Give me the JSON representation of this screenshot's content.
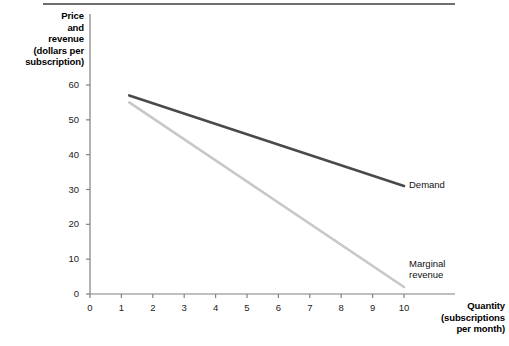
{
  "chart_data": {
    "type": "line",
    "title": "",
    "xlabel": "Quantity (subscriptions per month)",
    "ylabel": "Price and revenue (dollars per subscription)",
    "xlim": [
      0,
      10.7
    ],
    "ylim": [
      0,
      63
    ],
    "grid": false,
    "legend_position": "inline-end-of-line",
    "x_ticks": [
      "0",
      "1",
      "2",
      "3",
      "4",
      "5",
      "6",
      "7",
      "8",
      "9",
      "10"
    ],
    "x_tick_values": [
      0,
      1,
      2,
      3,
      4,
      5,
      6,
      7,
      8,
      9,
      10
    ],
    "y_ticks": [
      "0",
      "10",
      "20",
      "30",
      "40",
      "50",
      "60"
    ],
    "y_tick_values": [
      0,
      10,
      20,
      30,
      40,
      50,
      60
    ],
    "series": [
      {
        "name": "Demand",
        "color": "#4a4a4a",
        "x": [
          1.25,
          10
        ],
        "values": [
          57,
          31
        ]
      },
      {
        "name": "Marginal revenue",
        "color": "#c8c8c8",
        "x": [
          1.25,
          10
        ],
        "values": [
          55,
          2
        ]
      }
    ]
  },
  "axis_titles": {
    "y": [
      "Price",
      "and",
      "revenue",
      "(dollars per",
      "subscription)"
    ],
    "x": [
      "Quantity",
      "(subscriptions",
      "per month)"
    ]
  },
  "series_labels": {
    "demand": "Demand",
    "marginal_revenue_line1": "Marginal",
    "marginal_revenue_line2": "revenue"
  },
  "colors": {
    "demand_line": "#4a4a4a",
    "marginal_revenue_line": "#c8c8c8",
    "axis": "#808080",
    "top_rule": "#6e6e6e",
    "text": "#000000"
  }
}
